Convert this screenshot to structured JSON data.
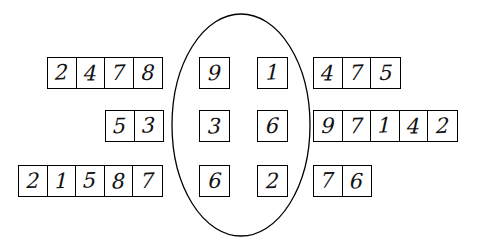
{
  "figure": {
    "background_color": "#ffffff",
    "line_color": "#000000",
    "digit_color": "#111111"
  },
  "ellipse": {
    "name": "highlight-ellipse",
    "center_x": 241,
    "center_y": 125,
    "radius_x": 69,
    "radius_y": 111,
    "stroke": "#000000",
    "stroke_width": 1.3,
    "fill": "none"
  },
  "rows": [
    {
      "id": "row-1",
      "top": 57,
      "left_segment": {
        "left": 47,
        "digits": [
          "2",
          "4",
          "7",
          "8"
        ]
      },
      "circled": [
        {
          "left": 199,
          "digit": "9"
        },
        {
          "left": 257,
          "digit": "1"
        }
      ],
      "right_segment": {
        "left": 313,
        "digits": [
          "4",
          "7",
          "5"
        ]
      }
    },
    {
      "id": "row-2",
      "top": 110,
      "left_segment": {
        "left": 105,
        "digits": [
          "5",
          "3"
        ]
      },
      "circled": [
        {
          "left": 199,
          "digit": "3"
        },
        {
          "left": 257,
          "digit": "6"
        }
      ],
      "right_segment": {
        "left": 313,
        "digits": [
          "9",
          "7",
          "1",
          "4",
          "2"
        ]
      }
    },
    {
      "id": "row-3",
      "top": 165,
      "left_segment": {
        "left": 18,
        "digits": [
          "2",
          "1",
          "5",
          "8",
          "7"
        ]
      },
      "circled": [
        {
          "left": 199,
          "digit": "6"
        },
        {
          "left": 257,
          "digit": "2"
        }
      ],
      "right_segment": {
        "left": 313,
        "digits": [
          "7",
          "6"
        ]
      }
    }
  ],
  "cell": {
    "width": 28.6,
    "height": 32
  }
}
